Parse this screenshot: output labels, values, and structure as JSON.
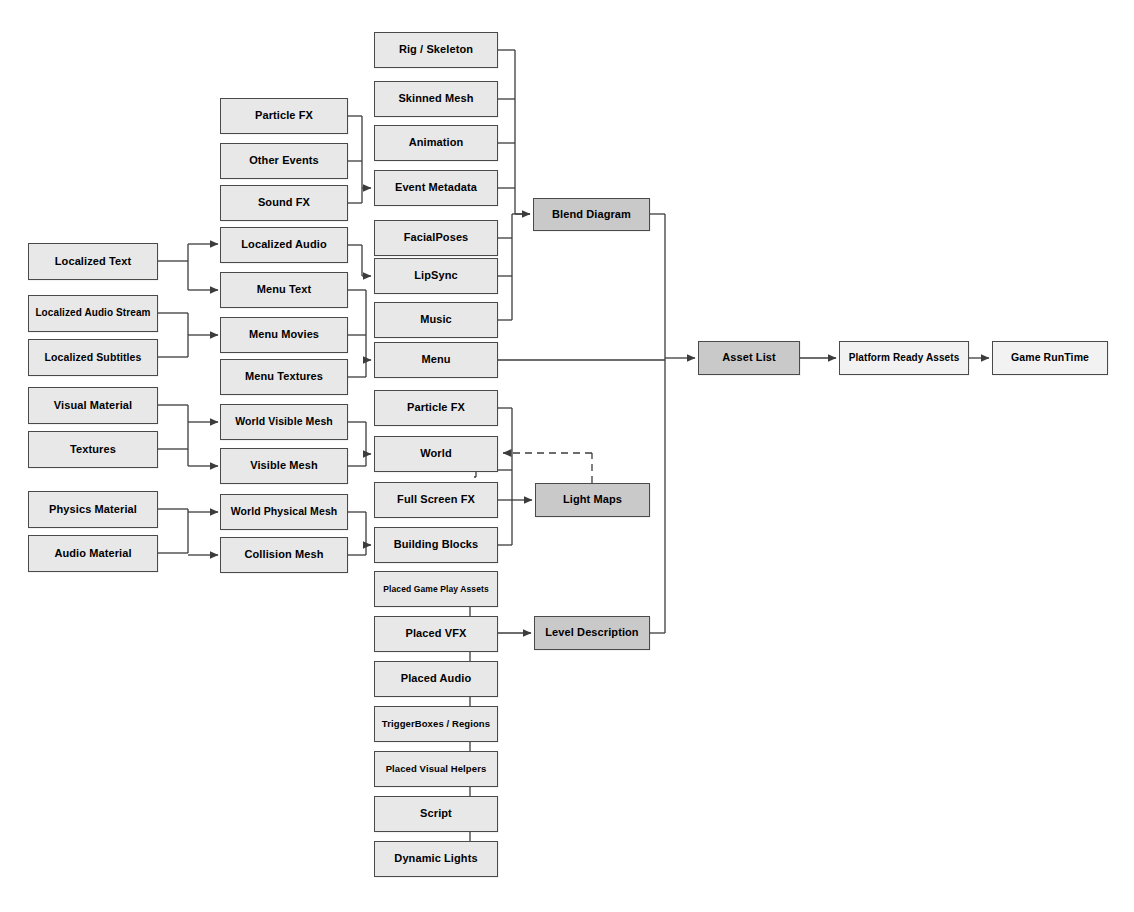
{
  "diagram": {
    "type": "flowchart",
    "background_color": "#ffffff",
    "node_fill_default": "#e8e8e8",
    "node_fill_emphasis": "#c9c9c9",
    "node_fill_light": "#f2f2f2",
    "node_border_color": "#4a4a4a",
    "edge_color": "#3c3c3c"
  },
  "nodes": [
    {
      "id": "localized_text",
      "label": "Localized Text",
      "x": 28,
      "y": 243,
      "w": 130,
      "h": 37,
      "fontSize": 11,
      "shade": "default"
    },
    {
      "id": "localized_audio_stream",
      "label": "Localized Audio Stream",
      "x": 28,
      "y": 295,
      "w": 130,
      "h": 37,
      "fontSize": 10,
      "shade": "default"
    },
    {
      "id": "localized_subtitles",
      "label": "Localized Subtitles",
      "x": 28,
      "y": 339,
      "w": 130,
      "h": 37,
      "fontSize": 10.5,
      "shade": "default"
    },
    {
      "id": "visual_material",
      "label": "Visual Material",
      "x": 28,
      "y": 387,
      "w": 130,
      "h": 37,
      "fontSize": 11,
      "shade": "default"
    },
    {
      "id": "textures",
      "label": "Textures",
      "x": 28,
      "y": 431,
      "w": 130,
      "h": 37,
      "fontSize": 11,
      "shade": "default"
    },
    {
      "id": "physics_material",
      "label": "Physics Material",
      "x": 28,
      "y": 491,
      "w": 130,
      "h": 37,
      "fontSize": 11,
      "shade": "default"
    },
    {
      "id": "audio_material",
      "label": "Audio Material",
      "x": 28,
      "y": 535,
      "w": 130,
      "h": 37,
      "fontSize": 11,
      "shade": "default"
    },
    {
      "id": "particle_fx_src",
      "label": "Particle FX",
      "x": 220,
      "y": 98,
      "w": 128,
      "h": 36,
      "fontSize": 11,
      "shade": "default"
    },
    {
      "id": "other_events",
      "label": "Other Events",
      "x": 220,
      "y": 143,
      "w": 128,
      "h": 36,
      "fontSize": 11,
      "shade": "default"
    },
    {
      "id": "sound_fx",
      "label": "Sound FX",
      "x": 220,
      "y": 185,
      "w": 128,
      "h": 36,
      "fontSize": 11,
      "shade": "default"
    },
    {
      "id": "localized_audio",
      "label": "Localized Audio",
      "x": 220,
      "y": 227,
      "w": 128,
      "h": 36,
      "fontSize": 11,
      "shade": "default"
    },
    {
      "id": "menu_text",
      "label": "Menu Text",
      "x": 220,
      "y": 272,
      "w": 128,
      "h": 36,
      "fontSize": 11,
      "shade": "default"
    },
    {
      "id": "menu_movies",
      "label": "Menu Movies",
      "x": 220,
      "y": 317,
      "w": 128,
      "h": 36,
      "fontSize": 11,
      "shade": "default"
    },
    {
      "id": "menu_textures",
      "label": "Menu Textures",
      "x": 220,
      "y": 359,
      "w": 128,
      "h": 36,
      "fontSize": 11,
      "shade": "default"
    },
    {
      "id": "world_visible_mesh",
      "label": "World Visible Mesh",
      "x": 220,
      "y": 404,
      "w": 128,
      "h": 36,
      "fontSize": 10.5,
      "shade": "default"
    },
    {
      "id": "visible_mesh",
      "label": "Visible Mesh",
      "x": 220,
      "y": 448,
      "w": 128,
      "h": 36,
      "fontSize": 11,
      "shade": "default"
    },
    {
      "id": "world_physical_mesh",
      "label": "World Physical Mesh",
      "x": 220,
      "y": 494,
      "w": 128,
      "h": 36,
      "fontSize": 10.5,
      "shade": "default"
    },
    {
      "id": "collision_mesh",
      "label": "Collision Mesh",
      "x": 220,
      "y": 537,
      "w": 128,
      "h": 36,
      "fontSize": 11,
      "shade": "default"
    },
    {
      "id": "rig_skeleton",
      "label": "Rig / Skeleton",
      "x": 374,
      "y": 32,
      "w": 124,
      "h": 36,
      "fontSize": 11,
      "shade": "default"
    },
    {
      "id": "skinned_mesh",
      "label": "Skinned Mesh",
      "x": 374,
      "y": 81,
      "w": 124,
      "h": 36,
      "fontSize": 11,
      "shade": "default"
    },
    {
      "id": "animation",
      "label": "Animation",
      "x": 374,
      "y": 125,
      "w": 124,
      "h": 36,
      "fontSize": 11,
      "shade": "default"
    },
    {
      "id": "event_metadata",
      "label": "Event Metadata",
      "x": 374,
      "y": 170,
      "w": 124,
      "h": 36,
      "fontSize": 11,
      "shade": "default"
    },
    {
      "id": "facial_poses",
      "label": "FacialPoses",
      "x": 374,
      "y": 220,
      "w": 124,
      "h": 36,
      "fontSize": 11,
      "shade": "default"
    },
    {
      "id": "lipsync",
      "label": "LipSync",
      "x": 374,
      "y": 258,
      "w": 124,
      "h": 36,
      "fontSize": 11,
      "shade": "default"
    },
    {
      "id": "music",
      "label": "Music",
      "x": 374,
      "y": 302,
      "w": 124,
      "h": 36,
      "fontSize": 11,
      "shade": "default"
    },
    {
      "id": "menu",
      "label": "Menu",
      "x": 374,
      "y": 342,
      "w": 124,
      "h": 36,
      "fontSize": 11,
      "shade": "default"
    },
    {
      "id": "particle_fx_mid",
      "label": "Particle FX",
      "x": 374,
      "y": 390,
      "w": 124,
      "h": 36,
      "fontSize": 11,
      "shade": "default"
    },
    {
      "id": "world",
      "label": "World",
      "x": 374,
      "y": 436,
      "w": 124,
      "h": 36,
      "fontSize": 11,
      "shade": "default"
    },
    {
      "id": "full_screen_fx",
      "label": "Full Screen FX",
      "x": 374,
      "y": 482,
      "w": 124,
      "h": 36,
      "fontSize": 11,
      "shade": "default"
    },
    {
      "id": "building_blocks",
      "label": "Building Blocks",
      "x": 374,
      "y": 527,
      "w": 124,
      "h": 36,
      "fontSize": 11,
      "shade": "default"
    },
    {
      "id": "placed_gameplay_assets",
      "label": "Placed Game Play Assets",
      "x": 374,
      "y": 571,
      "w": 124,
      "h": 36,
      "fontSize": 8.5,
      "shade": "default"
    },
    {
      "id": "placed_vfx",
      "label": "Placed VFX",
      "x": 374,
      "y": 616,
      "w": 124,
      "h": 36,
      "fontSize": 11,
      "shade": "default"
    },
    {
      "id": "placed_audio",
      "label": "Placed Audio",
      "x": 374,
      "y": 661,
      "w": 124,
      "h": 36,
      "fontSize": 11,
      "shade": "default"
    },
    {
      "id": "trigger_boxes_regions",
      "label": "TriggerBoxes / Regions",
      "x": 374,
      "y": 706,
      "w": 124,
      "h": 36,
      "fontSize": 9.5,
      "shade": "default"
    },
    {
      "id": "placed_visual_helpers",
      "label": "Placed Visual Helpers",
      "x": 374,
      "y": 751,
      "w": 124,
      "h": 36,
      "fontSize": 9.5,
      "shade": "default"
    },
    {
      "id": "script",
      "label": "Script",
      "x": 374,
      "y": 796,
      "w": 124,
      "h": 36,
      "fontSize": 11,
      "shade": "default"
    },
    {
      "id": "dynamic_lights",
      "label": "Dynamic Lights",
      "x": 374,
      "y": 841,
      "w": 124,
      "h": 36,
      "fontSize": 11,
      "shade": "default"
    },
    {
      "id": "blend_diagram",
      "label": "Blend Diagram",
      "x": 533,
      "y": 198,
      "w": 117,
      "h": 33,
      "fontSize": 11,
      "shade": "dark"
    },
    {
      "id": "light_maps",
      "label": "Light Maps",
      "x": 535,
      "y": 483,
      "w": 115,
      "h": 34,
      "fontSize": 11,
      "shade": "dark"
    },
    {
      "id": "level_description",
      "label": "Level Description",
      "x": 534,
      "y": 616,
      "w": 116,
      "h": 34,
      "fontSize": 11,
      "shade": "dark"
    },
    {
      "id": "asset_list",
      "label": "Asset List",
      "x": 698,
      "y": 341,
      "w": 102,
      "h": 34,
      "fontSize": 11,
      "shade": "dark"
    },
    {
      "id": "platform_ready_assets",
      "label": "Platform Ready Assets",
      "x": 839,
      "y": 341,
      "w": 130,
      "h": 34,
      "fontSize": 10,
      "shade": "light"
    },
    {
      "id": "game_runtime",
      "label": "Game RunTime",
      "x": 992,
      "y": 341,
      "w": 116,
      "h": 34,
      "fontSize": 10.5,
      "shade": "light"
    }
  ],
  "edges": [
    {
      "from": "localized_text",
      "to": "localized_audio",
      "style": "solid",
      "arrow": true
    },
    {
      "from": "localized_text",
      "to": "menu_text",
      "style": "solid",
      "arrow": true
    },
    {
      "from": "localized_audio_stream",
      "to": "menu_movies",
      "style": "solid",
      "arrow": true
    },
    {
      "from": "localized_subtitles",
      "to": "menu_movies",
      "style": "solid",
      "arrow": true
    },
    {
      "from": "visual_material",
      "to": "world_visible_mesh",
      "style": "solid",
      "arrow": true
    },
    {
      "from": "visual_material",
      "to": "visible_mesh",
      "style": "solid",
      "arrow": true
    },
    {
      "from": "textures",
      "to": "world_visible_mesh",
      "style": "solid",
      "arrow": true
    },
    {
      "from": "textures",
      "to": "visible_mesh",
      "style": "solid",
      "arrow": true
    },
    {
      "from": "physics_material",
      "to": "world_physical_mesh",
      "style": "solid",
      "arrow": true
    },
    {
      "from": "physics_material",
      "to": "collision_mesh",
      "style": "solid",
      "arrow": true
    },
    {
      "from": "audio_material",
      "to": "world_physical_mesh",
      "style": "solid",
      "arrow": true
    },
    {
      "from": "audio_material",
      "to": "collision_mesh",
      "style": "solid",
      "arrow": true
    },
    {
      "from": "particle_fx_src",
      "to": "event_metadata",
      "style": "solid",
      "arrow": true
    },
    {
      "from": "other_events",
      "to": "event_metadata",
      "style": "solid",
      "arrow": true
    },
    {
      "from": "sound_fx",
      "to": "event_metadata",
      "style": "solid",
      "arrow": true
    },
    {
      "from": "localized_audio",
      "to": "lipsync",
      "style": "solid",
      "arrow": true
    },
    {
      "from": "menu_text",
      "to": "menu",
      "style": "solid",
      "arrow": true
    },
    {
      "from": "menu_movies",
      "to": "menu",
      "style": "solid",
      "arrow": true
    },
    {
      "from": "menu_textures",
      "to": "menu",
      "style": "solid",
      "arrow": true
    },
    {
      "from": "world_visible_mesh",
      "to": "world",
      "style": "solid",
      "arrow": true
    },
    {
      "from": "visible_mesh",
      "to": "world",
      "style": "solid",
      "arrow": true
    },
    {
      "from": "world_physical_mesh",
      "to": "building_blocks",
      "style": "solid",
      "arrow": true
    },
    {
      "from": "collision_mesh",
      "to": "building_blocks",
      "style": "solid",
      "arrow": true
    },
    {
      "from": "rig_skeleton",
      "to": "blend_diagram",
      "style": "solid",
      "arrow": true
    },
    {
      "from": "skinned_mesh",
      "to": "blend_diagram",
      "style": "solid",
      "arrow": true
    },
    {
      "from": "animation",
      "to": "blend_diagram",
      "style": "solid",
      "arrow": true
    },
    {
      "from": "event_metadata",
      "to": "blend_diagram",
      "style": "solid",
      "arrow": true
    },
    {
      "from": "facial_poses",
      "to": "blend_diagram",
      "style": "solid",
      "arrow": true
    },
    {
      "from": "lipsync",
      "to": "blend_diagram",
      "style": "solid",
      "arrow": true
    },
    {
      "from": "music",
      "to": "blend_diagram",
      "style": "solid",
      "arrow": true
    },
    {
      "from": "menu",
      "to": "asset_list",
      "style": "solid",
      "arrow": true
    },
    {
      "from": "blend_diagram",
      "to": "asset_list",
      "style": "solid",
      "arrow": true
    },
    {
      "from": "level_description",
      "to": "asset_list",
      "style": "solid",
      "arrow": true
    },
    {
      "from": "particle_fx_mid",
      "to": "light_maps",
      "style": "solid",
      "arrow": true
    },
    {
      "from": "world",
      "to": "light_maps",
      "style": "solid",
      "arrow": true
    },
    {
      "from": "full_screen_fx",
      "to": "light_maps",
      "style": "solid",
      "arrow": true
    },
    {
      "from": "building_blocks",
      "to": "light_maps",
      "style": "solid",
      "arrow": true
    },
    {
      "from": "light_maps",
      "to": "world",
      "style": "dashed",
      "arrow": true
    },
    {
      "from": "placed_gameplay_assets",
      "to": "level_description",
      "style": "solid",
      "arrow": true
    },
    {
      "from": "placed_vfx",
      "to": "level_description",
      "style": "solid",
      "arrow": true
    },
    {
      "from": "placed_audio",
      "to": "level_description",
      "style": "solid",
      "arrow": true
    },
    {
      "from": "trigger_boxes_regions",
      "to": "level_description",
      "style": "solid",
      "arrow": true
    },
    {
      "from": "placed_visual_helpers",
      "to": "level_description",
      "style": "solid",
      "arrow": true
    },
    {
      "from": "script",
      "to": "level_description",
      "style": "solid",
      "arrow": true
    },
    {
      "from": "dynamic_lights",
      "to": "level_description",
      "style": "solid",
      "arrow": true
    },
    {
      "from": "asset_list",
      "to": "platform_ready_assets",
      "style": "solid",
      "arrow": true
    },
    {
      "from": "platform_ready_assets",
      "to": "game_runtime",
      "style": "solid",
      "arrow": true
    }
  ],
  "edge_paths": [
    {
      "name": "localized-text-fanout",
      "d": "M158,261 L188,261 M188,244 L188,290 M188,244 L205,244 M188,290 L205,290",
      "style": "solid"
    },
    {
      "name": "arrow-localized-audio",
      "d": "M205,244 L218,244",
      "style": "solid",
      "arrow": true
    },
    {
      "name": "arrow-menu-text",
      "d": "M205,290 L218,290",
      "style": "solid",
      "arrow": true
    },
    {
      "name": "localized-stream-fanout",
      "d": "M158,313 L188,313 M158,357 L188,357 M188,313 L188,357 M188,335 L205,335",
      "style": "solid"
    },
    {
      "name": "arrow-menu-movies",
      "d": "M205,335 L218,335",
      "style": "solid",
      "arrow": true
    },
    {
      "name": "material-fanout",
      "d": "M158,405 L188,405 M158,449 L188,449 M188,405 L188,466 M188,422 L205,422 M188,466 L205,466",
      "style": "solid"
    },
    {
      "name": "arrow-world-visible-mesh",
      "d": "M205,422 L218,422",
      "style": "solid",
      "arrow": true
    },
    {
      "name": "arrow-visible-mesh",
      "d": "M205,466 L218,466",
      "style": "solid",
      "arrow": true
    },
    {
      "name": "physics-audio-fanout",
      "d": "M158,509 L188,509 M158,553 L188,553 M188,509 L188,553 M188,512 L205,512 M188,555 L205,555",
      "style": "solid"
    },
    {
      "name": "arrow-world-physical-mesh",
      "d": "M205,512 L218,512",
      "style": "solid",
      "arrow": true
    },
    {
      "name": "arrow-collision-mesh",
      "d": "M205,555 L218,555",
      "style": "solid",
      "arrow": true
    },
    {
      "name": "events-collector",
      "d": "M348,116 L362,116 M348,161 L362,161 M348,203 L362,203 M362,116 L362,203 M362,188 L371,188",
      "style": "solid",
      "arrow": true
    },
    {
      "name": "localized-audio-to-lipsync",
      "d": "M348,245 L362,245 M362,245 L362,276 M362,276 L371,276",
      "style": "solid",
      "arrow": true
    },
    {
      "name": "menu-collector",
      "d": "M348,290 L366,290 M348,335 L366,335 M348,377 L366,377 M366,290 L366,377 M366,360 L371,360",
      "style": "solid",
      "arrow": true
    },
    {
      "name": "mesh-to-world",
      "d": "M348,422 L366,422 M348,466 L366,466 M366,422 L366,466 M366,454 L371,454",
      "style": "solid",
      "arrow": true
    },
    {
      "name": "mesh-to-building-blocks",
      "d": "M348,512 L366,512 M348,555 L366,555 M366,512 L366,555 M366,545 L371,545",
      "style": "solid",
      "arrow": true
    },
    {
      "name": "blend-collector",
      "d": "M498,50 L515,50 M498,99 L515,99 M498,143 L515,143 M498,188 L515,188 M515,50 L515,214 M515,214 L530,214",
      "style": "solid",
      "arrow": true
    },
    {
      "name": "face-music-collector",
      "d": "M498,238 L512,238 M498,276 L512,276 M498,320 L512,320 M512,238 L512,320 M512,238 L512,214 M512,214 L530,214",
      "style": "solid"
    },
    {
      "name": "menu-to-bus",
      "d": "M498,360 L665,360",
      "style": "solid"
    },
    {
      "name": "blend-to-bus",
      "d": "M650,214 L665,214 M665,214 L665,360",
      "style": "solid"
    },
    {
      "name": "level-desc-to-bus",
      "d": "M650,633 L665,633 M665,633 L665,360",
      "style": "solid"
    },
    {
      "name": "bus-to-asset-list",
      "d": "M665,358 L695,358",
      "style": "solid",
      "arrow": true
    },
    {
      "name": "lightmaps-collector",
      "d": "M498,408 L512,408 M498,470 L512,470 M498,500 L512,500 M498,545 L512,545 M512,408 L512,545 M512,500 L532,500",
      "style": "solid",
      "arrow": true
    },
    {
      "name": "world-wrap",
      "d": "M476,472 L476,477 M476,477 L474,477",
      "style": "solid"
    },
    {
      "name": "lightmaps-to-world-dashed",
      "d": "M592,483 L592,453 M592,453 L503,453",
      "style": "dashed",
      "arrow": true
    },
    {
      "name": "level-collector",
      "d": "M498,589 L470,589 M470,589 L470,859 M498,634 L470,634 M498,679 L470,679 M498,724 L470,724 M498,769 L470,769 M498,814 L470,814 M498,859 L470,859 M470,633 L531,633",
      "style": "solid",
      "arrow": true
    },
    {
      "name": "asset-to-platform",
      "d": "M800,358 L836,358",
      "style": "solid",
      "arrow": true
    },
    {
      "name": "platform-to-runtime",
      "d": "M969,358 L989,358",
      "style": "solid",
      "arrow": true
    }
  ]
}
